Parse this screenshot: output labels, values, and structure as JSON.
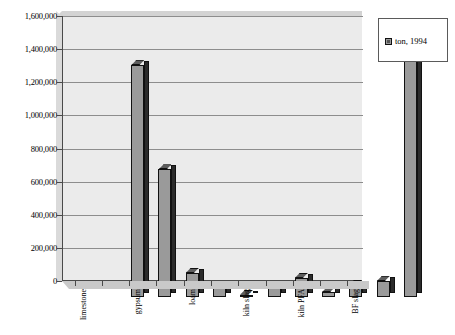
{
  "legend": {
    "position": "right",
    "entries": [
      {
        "label": "ton, 1994",
        "swatch_icon": "square-swatch-icon",
        "color": "#9a9a9a"
      }
    ]
  },
  "axes": {
    "y": {
      "ticks": [
        "0",
        "200,000",
        "400,000",
        "600,000",
        "800,000",
        "1,000,000",
        "1,200,000",
        "1,400,000",
        "1,600,000"
      ],
      "min": 0,
      "max": 1600000,
      "step": 200000,
      "label": ""
    },
    "x": {
      "label": "",
      "visible_tick_labels": [
        "limestone",
        "gypsum",
        "loam",
        "kiln slag",
        "kiln PFA",
        "BF slag"
      ]
    }
  },
  "chart_data": {
    "type": "bar",
    "title": "",
    "subtitle": "",
    "xlabel": "",
    "ylabel": "",
    "ylim": [
      0,
      1600000
    ],
    "ytick_step": 200000,
    "grid": true,
    "legend_position": "right",
    "categories": [
      "limestone",
      "",
      "gypsum",
      "",
      "loam",
      "",
      "kiln slag",
      "",
      "kiln PFA",
      "",
      "BF slag"
    ],
    "series": [
      {
        "name": "ton, 1994",
        "color": "#9a9a9a",
        "values": [
          1400000,
          770000,
          145000,
          65000,
          15000,
          55000,
          115000,
          30000,
          75000,
          95000,
          1490000
        ]
      }
    ]
  }
}
